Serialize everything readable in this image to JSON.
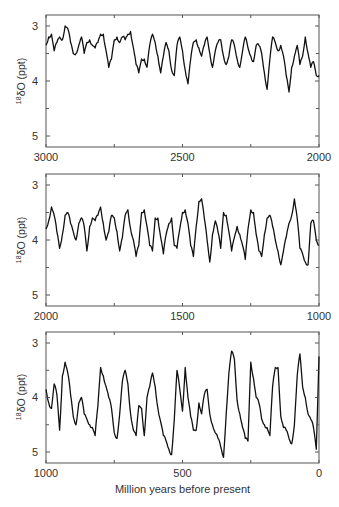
{
  "chart_data": [
    {
      "type": "line",
      "title": "",
      "xlabel": "",
      "ylabel": "18δO (ppt)",
      "xlim": [
        3000,
        2000
      ],
      "ylim": [
        5.2,
        2.8
      ],
      "y_inverted": true,
      "x_ticks": [
        3000,
        2500,
        2000
      ],
      "y_ticks": [
        3,
        4,
        5
      ],
      "grid": false,
      "x": [
        3000,
        2990,
        2980,
        2970,
        2960,
        2950,
        2940,
        2930,
        2920,
        2910,
        2900,
        2890,
        2880,
        2870,
        2860,
        2850,
        2840,
        2830,
        2820,
        2810,
        2800,
        2790,
        2780,
        2770,
        2760,
        2750,
        2740,
        2730,
        2720,
        2710,
        2700,
        2690,
        2680,
        2670,
        2660,
        2650,
        2640,
        2630,
        2620,
        2610,
        2600,
        2590,
        2580,
        2570,
        2560,
        2550,
        2540,
        2530,
        2520,
        2510,
        2500,
        2490,
        2480,
        2470,
        2460,
        2450,
        2440,
        2430,
        2420,
        2410,
        2400,
        2390,
        2380,
        2370,
        2360,
        2350,
        2340,
        2330,
        2320,
        2310,
        2300,
        2290,
        2280,
        2270,
        2260,
        2250,
        2240,
        2230,
        2220,
        2210,
        2200,
        2190,
        2180,
        2170,
        2160,
        2150,
        2140,
        2130,
        2120,
        2110,
        2100,
        2090,
        2080,
        2070,
        2060,
        2050,
        2040,
        2030,
        2020,
        2010,
        2000
      ],
      "values": [
        3.35,
        3.2,
        3.15,
        3.45,
        3.3,
        3.2,
        3.25,
        3.0,
        3.05,
        3.3,
        3.5,
        3.5,
        3.35,
        3.2,
        3.5,
        3.3,
        3.25,
        3.35,
        3.4,
        3.3,
        3.15,
        3.15,
        3.45,
        3.75,
        3.6,
        3.25,
        3.2,
        3.3,
        3.2,
        3.25,
        3.15,
        3.1,
        3.4,
        3.7,
        3.85,
        3.6,
        3.6,
        3.75,
        3.35,
        3.15,
        3.3,
        3.55,
        3.85,
        3.55,
        3.3,
        3.45,
        3.8,
        3.9,
        3.35,
        3.2,
        3.45,
        3.8,
        4.05,
        3.6,
        3.3,
        3.25,
        3.4,
        3.55,
        3.35,
        3.2,
        3.5,
        3.75,
        3.45,
        3.3,
        3.25,
        3.55,
        3.7,
        3.55,
        3.25,
        3.35,
        3.6,
        3.75,
        3.45,
        3.2,
        3.4,
        3.55,
        3.65,
        3.35,
        3.35,
        3.5,
        3.85,
        4.15,
        3.6,
        3.2,
        3.3,
        3.45,
        3.35,
        3.55,
        3.9,
        4.2,
        3.75,
        3.55,
        3.35,
        3.7,
        3.55,
        3.2,
        3.5,
        3.75,
        3.65,
        3.9,
        3.9
      ]
    },
    {
      "type": "line",
      "title": "",
      "xlabel": "",
      "ylabel": "18δO (ppt)",
      "xlim": [
        2000,
        1000
      ],
      "ylim": [
        5.2,
        2.8
      ],
      "y_inverted": true,
      "x_ticks": [
        2000,
        1500,
        1000
      ],
      "y_ticks": [
        3,
        4,
        5
      ],
      "grid": false,
      "x": [
        2000,
        1990,
        1980,
        1970,
        1960,
        1950,
        1940,
        1930,
        1920,
        1910,
        1900,
        1890,
        1880,
        1870,
        1860,
        1850,
        1840,
        1830,
        1820,
        1810,
        1800,
        1790,
        1780,
        1770,
        1760,
        1750,
        1740,
        1730,
        1720,
        1710,
        1700,
        1690,
        1680,
        1670,
        1660,
        1650,
        1640,
        1630,
        1620,
        1610,
        1600,
        1590,
        1580,
        1570,
        1560,
        1550,
        1540,
        1530,
        1520,
        1510,
        1500,
        1490,
        1480,
        1470,
        1460,
        1450,
        1440,
        1430,
        1420,
        1410,
        1400,
        1390,
        1380,
        1370,
        1360,
        1350,
        1340,
        1330,
        1320,
        1310,
        1300,
        1290,
        1280,
        1270,
        1260,
        1250,
        1240,
        1230,
        1220,
        1210,
        1200,
        1190,
        1180,
        1170,
        1160,
        1150,
        1140,
        1130,
        1120,
        1110,
        1100,
        1090,
        1080,
        1070,
        1060,
        1050,
        1040,
        1030,
        1020,
        1010,
        1000
      ],
      "values": [
        3.8,
        3.65,
        3.4,
        3.55,
        3.85,
        4.15,
        3.9,
        3.55,
        3.5,
        3.7,
        3.85,
        4.0,
        3.7,
        3.6,
        3.75,
        4.2,
        3.75,
        3.6,
        3.65,
        3.55,
        3.4,
        3.7,
        4.0,
        3.85,
        3.55,
        3.6,
        3.85,
        4.2,
        3.95,
        3.55,
        3.45,
        3.8,
        4.0,
        4.3,
        4.1,
        3.5,
        3.45,
        3.75,
        4.1,
        4.2,
        3.6,
        3.6,
        3.95,
        4.25,
        3.9,
        3.7,
        3.6,
        4.1,
        4.15,
        3.8,
        3.5,
        3.45,
        3.7,
        4.1,
        4.3,
        3.75,
        3.3,
        3.25,
        3.6,
        4.0,
        4.4,
        3.9,
        3.65,
        3.85,
        4.15,
        3.5,
        3.55,
        3.85,
        4.2,
        3.95,
        3.75,
        3.9,
        4.1,
        4.35,
        3.8,
        3.45,
        3.5,
        3.9,
        4.2,
        4.3,
        3.9,
        3.6,
        3.55,
        3.75,
        4.0,
        4.2,
        4.45,
        4.2,
        3.95,
        3.7,
        3.55,
        3.25,
        3.6,
        4.15,
        4.25,
        4.4,
        4.45,
        3.7,
        3.65,
        4.0,
        4.1
      ]
    },
    {
      "type": "line",
      "title": "",
      "xlabel": "Million years before present",
      "ylabel": "18δO (ppt)",
      "xlim": [
        1000,
        0
      ],
      "ylim": [
        5.2,
        2.8
      ],
      "y_inverted": true,
      "x_ticks": [
        1000,
        500,
        0
      ],
      "y_ticks": [
        3,
        4,
        5
      ],
      "grid": false,
      "x": [
        1000,
        990,
        980,
        970,
        960,
        950,
        940,
        930,
        920,
        910,
        900,
        890,
        880,
        870,
        860,
        850,
        840,
        830,
        820,
        810,
        800,
        790,
        780,
        770,
        760,
        750,
        740,
        730,
        720,
        710,
        700,
        690,
        680,
        670,
        660,
        650,
        640,
        630,
        620,
        610,
        600,
        590,
        580,
        570,
        560,
        550,
        540,
        530,
        520,
        510,
        500,
        490,
        480,
        470,
        460,
        450,
        440,
        430,
        420,
        410,
        400,
        390,
        380,
        370,
        360,
        350,
        340,
        330,
        320,
        310,
        300,
        290,
        280,
        270,
        260,
        250,
        240,
        230,
        220,
        210,
        200,
        190,
        180,
        170,
        160,
        150,
        140,
        130,
        120,
        110,
        100,
        90,
        80,
        70,
        60,
        50,
        40,
        30,
        20,
        10,
        0
      ],
      "values": [
        3.85,
        4.1,
        4.2,
        3.75,
        3.95,
        4.6,
        3.6,
        3.35,
        3.55,
        3.95,
        4.35,
        4.5,
        4.1,
        4.0,
        4.3,
        4.4,
        4.5,
        4.55,
        4.7,
        4.15,
        3.45,
        3.6,
        3.8,
        4.0,
        4.2,
        4.65,
        4.75,
        4.3,
        3.7,
        3.5,
        3.75,
        4.3,
        4.6,
        4.7,
        4.15,
        4.2,
        4.7,
        4.0,
        3.8,
        3.55,
        3.8,
        4.2,
        4.45,
        4.7,
        4.8,
        4.95,
        5.05,
        4.4,
        3.5,
        3.85,
        4.25,
        3.45,
        4.0,
        4.35,
        4.6,
        4.6,
        4.1,
        4.3,
        3.95,
        3.85,
        4.3,
        4.5,
        4.65,
        4.75,
        4.9,
        5.1,
        4.3,
        3.55,
        3.15,
        3.3,
        4.05,
        4.3,
        4.55,
        4.75,
        4.8,
        3.35,
        3.65,
        4.0,
        4.1,
        4.4,
        4.5,
        4.55,
        4.7,
        3.8,
        3.45,
        3.45,
        4.35,
        4.55,
        4.6,
        4.75,
        4.85,
        4.5,
        3.6,
        3.2,
        3.8,
        4.0,
        4.3,
        4.4,
        4.55,
        4.95,
        3.25
      ]
    }
  ],
  "labels": {
    "ylabel_sup": "18",
    "ylabel_main": "δO (ppt)",
    "xlabel": "Million years before present"
  },
  "panels": [
    {
      "x_ticks": [
        "3000",
        "2500",
        "2000"
      ],
      "y_ticks": [
        "3",
        "4",
        "5"
      ]
    },
    {
      "x_ticks": [
        "2000",
        "1500",
        "1000"
      ],
      "y_ticks": [
        "3",
        "4",
        "5"
      ]
    },
    {
      "x_ticks": [
        "1000",
        "500",
        "0"
      ],
      "y_ticks": [
        "3",
        "4",
        "5"
      ]
    }
  ],
  "colors": {
    "line": "#111111",
    "axis": "#555555",
    "text": "#333333"
  }
}
